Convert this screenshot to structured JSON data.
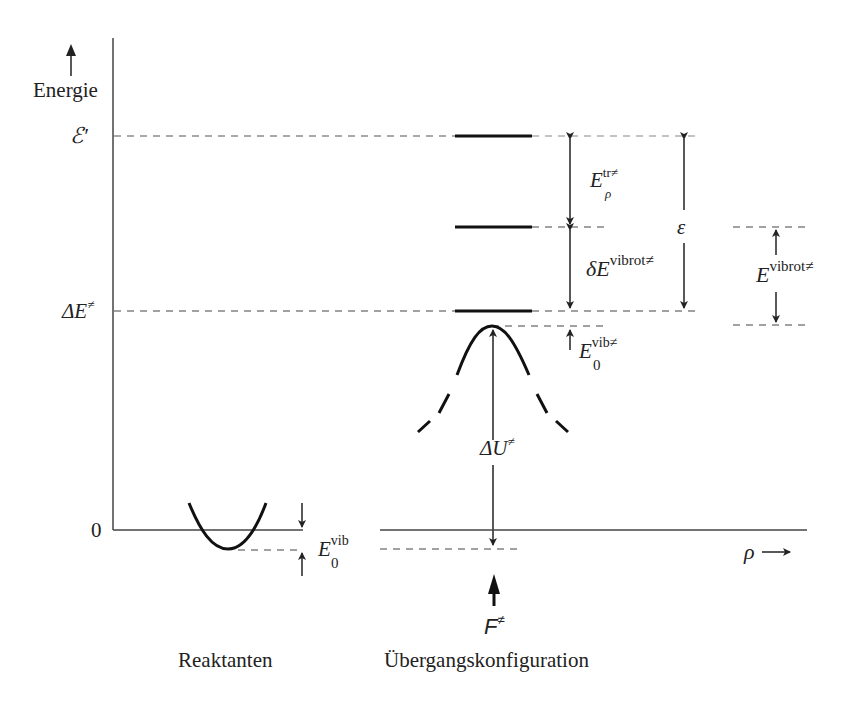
{
  "diagram": {
    "y_axis_label": "Energie",
    "x_axis_label": "ρ",
    "levels": {
      "e_prime": "ℰ′",
      "delta_e": "ΔE",
      "delta_e_sup": "≠",
      "zero": "0"
    },
    "annotations": {
      "e_tr_main": "E",
      "e_tr_sup": "tr≠",
      "e_tr_sub": "ρ",
      "d_e_vibrot_main": "δE",
      "d_e_vibrot_sup": "vibrot≠",
      "epsilon": "ε",
      "e_vibrot_main": "E",
      "e_vibrot_sup": "vibrot≠",
      "e0_vib_ts_main": "E",
      "e0_vib_ts_sup": "vib≠",
      "e0_vib_ts_sub": "0",
      "delta_u_main": "ΔU",
      "delta_u_sup": "≠",
      "e0_vib_main": "E",
      "e0_vib_sup": "vib",
      "e0_vib_sub": "0",
      "f_main": "F",
      "f_sup": "≠"
    },
    "labels": {
      "reactants": "Reaktanten",
      "transition": "Übergangskonfiguration"
    }
  }
}
